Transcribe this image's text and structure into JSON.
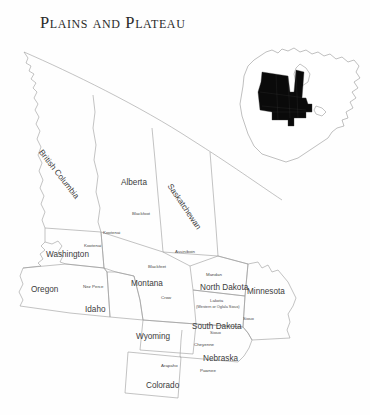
{
  "title": "Plains and Plateau",
  "map": {
    "type": "reference-map",
    "region": "Plains and Plateau culture areas of North America",
    "line_color": "#9a9a9a",
    "label_color": "#3c3c3c",
    "background_color": "#ffffff",
    "highlight_color": "#0a0a0a"
  },
  "inset": {
    "name": "north-america-locator",
    "description": "North America outline with Plains and Plateau region filled black"
  },
  "provinces": [
    {
      "name": "British Columbia",
      "x": 44,
      "y": 148,
      "rotate": 52
    },
    {
      "name": "Alberta",
      "x": 121,
      "y": 178,
      "rotate": 0
    },
    {
      "name": "Saskatchewan",
      "x": 173,
      "y": 182,
      "rotate": 56
    }
  ],
  "states": [
    {
      "name": "Washington",
      "x": 46,
      "y": 250
    },
    {
      "name": "Oregon",
      "x": 31,
      "y": 285
    },
    {
      "name": "Idaho",
      "x": 85,
      "y": 305
    },
    {
      "name": "Montana",
      "x": 131,
      "y": 279
    },
    {
      "name": "Wyoming",
      "x": 136,
      "y": 332
    },
    {
      "name": "Colorado",
      "x": 146,
      "y": 381
    },
    {
      "name": "North Dakota",
      "x": 200,
      "y": 283
    },
    {
      "name": "South Dakota",
      "x": 192,
      "y": 322
    },
    {
      "name": "Nebraska",
      "x": 203,
      "y": 354
    },
    {
      "name": "Minnesota",
      "x": 247,
      "y": 287
    }
  ],
  "tribes": [
    {
      "name": "Blackfoot",
      "x": 132,
      "y": 211
    },
    {
      "name": "Assiniboin",
      "x": 175,
      "y": 249
    },
    {
      "name": "Kootenai",
      "x": 103,
      "y": 230
    },
    {
      "name": "Kootenai",
      "x": 84,
      "y": 243
    },
    {
      "name": "Blackfeet",
      "x": 148,
      "y": 264
    },
    {
      "name": "Nez Perce",
      "x": 83,
      "y": 284
    },
    {
      "name": "Crow",
      "x": 161,
      "y": 295
    },
    {
      "name": "Mandan",
      "x": 206,
      "y": 272
    },
    {
      "name": "Lakota",
      "x": 210,
      "y": 298
    },
    {
      "name": "(Western or Oglala Sioux)",
      "x": 196,
      "y": 305
    },
    {
      "name": "Sioux",
      "x": 243,
      "y": 316
    },
    {
      "name": "Sioux",
      "x": 210,
      "y": 330
    },
    {
      "name": "Cheyenne",
      "x": 194,
      "y": 342
    },
    {
      "name": "Arapaho",
      "x": 161,
      "y": 363
    },
    {
      "name": "Pawnee",
      "x": 200,
      "y": 368
    }
  ]
}
